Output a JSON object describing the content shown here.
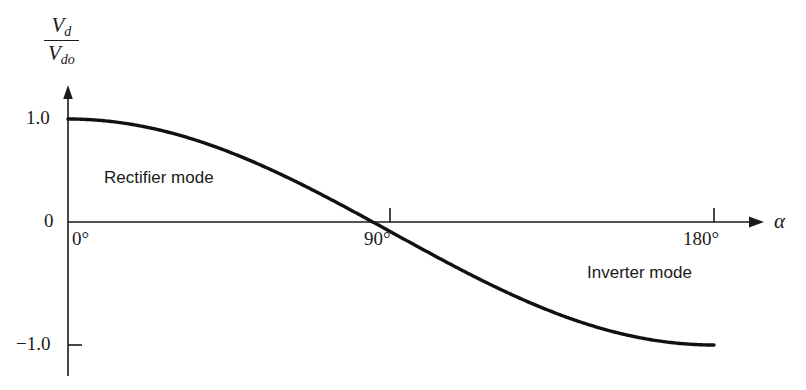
{
  "chart_data": {
    "type": "line",
    "title": "",
    "subtitle": "",
    "xlabel": "alpha",
    "ylabel": "Vd/Vdo",
    "xlim": [
      0,
      180
    ],
    "ylim": [
      -1.0,
      1.0
    ],
    "grid": false,
    "legend": "none",
    "function": "Vd/Vdo = cos(alpha)",
    "x": [
      0,
      10,
      20,
      30,
      40,
      50,
      60,
      70,
      80,
      90,
      100,
      110,
      120,
      130,
      140,
      150,
      160,
      170,
      180
    ],
    "values": [
      1.0,
      0.985,
      0.94,
      0.866,
      0.766,
      0.643,
      0.5,
      0.342,
      0.174,
      0.0,
      -0.174,
      -0.342,
      -0.5,
      -0.643,
      -0.766,
      -0.866,
      -0.94,
      -0.985,
      -1.0
    ],
    "x_tick_labels": [
      "0°",
      "90°",
      "180°"
    ],
    "x_tick_values": [
      0,
      90,
      180
    ],
    "y_tick_labels": [
      "1.0",
      "0",
      "−1.0"
    ],
    "y_tick_values": [
      1.0,
      0,
      -1.0
    ],
    "annotations": [
      {
        "text": "Rectifier mode",
        "x": 30,
        "y": 0.5
      },
      {
        "text": "Inverter mode",
        "x": 128,
        "y": -0.38
      }
    ]
  },
  "axes": {
    "y_axis_label": {
      "numerator_var": "V",
      "numerator_sub": "d",
      "denominator_var": "V",
      "denominator_sub": "do"
    },
    "x_axis_symbol": "α"
  },
  "ticks": {
    "y": {
      "top": "1.0",
      "zero": "0",
      "bottom": "−1.0"
    },
    "x": {
      "zero": "0°",
      "ninety": "90°",
      "oneeighty": "180°"
    }
  },
  "annotations": {
    "rectifier": "Rectifier mode",
    "inverter": "Inverter mode"
  },
  "colors": {
    "ink": "#1a1a1a",
    "curve": "#111111",
    "background": "#ffffff"
  }
}
